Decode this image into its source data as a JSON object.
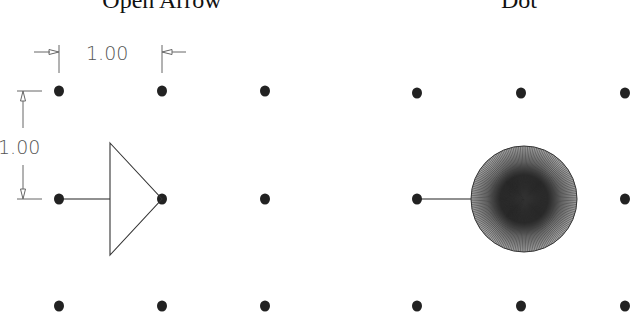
{
  "panels": [
    {
      "title": "Open Arrow",
      "title_x": 162,
      "grid_x": [
        59,
        162,
        265
      ],
      "grid_y": [
        91,
        199,
        306
      ],
      "arrow_type": "open-arrow",
      "line_from": [
        59,
        199
      ],
      "line_to": [
        110,
        199
      ],
      "triangle": {
        "base_x": 110,
        "top_y": 143,
        "bottom_y": 255,
        "apex": [
          162,
          199
        ]
      }
    },
    {
      "title": "Dot",
      "title_x": 519,
      "grid_x": [
        417,
        521,
        625
      ],
      "grid_y": [
        93,
        199,
        306
      ],
      "arrow_type": "dot",
      "line_from": [
        417,
        199
      ],
      "line_to": [
        472,
        199
      ],
      "dot": {
        "cx": 524,
        "cy": 199,
        "r": 53
      }
    }
  ],
  "dimensions": {
    "horizontal": {
      "label": "1.00",
      "x1": 59,
      "x2": 162,
      "y": 55
    },
    "vertical": {
      "label": "1.00",
      "y1": 91,
      "y2": 199,
      "x": 22
    }
  },
  "colors": {
    "ink": "#222222",
    "dim_ink": "#666666",
    "background": "#ffffff"
  }
}
